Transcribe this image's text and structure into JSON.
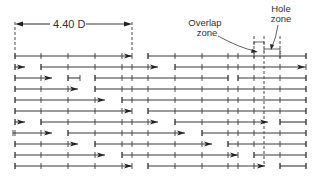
{
  "figure": {
    "dimension_label": "4.40 D",
    "overlap_label_line1": "Overlap",
    "overlap_label_line2": "zone",
    "hole_label_line1": "Hole",
    "hole_label_line2": "zone",
    "colors": {
      "ink": "#3a3a3a",
      "background": "#ffffff"
    }
  },
  "layout": {
    "row_y_start": 56,
    "row_spacing": 11,
    "tick_half_height": 3
  },
  "rows": [
    {
      "segments": [
        [
          15,
          132,
          "arrow"
        ],
        [
          148,
          306,
          "tick"
        ]
      ]
    },
    {
      "segments": [
        [
          15,
          25,
          "arrow"
        ],
        [
          41,
          158,
          "arrow"
        ],
        [
          175,
          306,
          "arrow-end"
        ]
      ]
    },
    {
      "segments": [
        [
          15,
          52,
          "arrow"
        ],
        [
          68,
          80,
          "tick"
        ],
        [
          95,
          228,
          "tick"
        ],
        [
          238,
          306,
          "tick"
        ]
      ]
    },
    {
      "segments": [
        [
          15,
          78,
          "arrow"
        ],
        [
          95,
          306,
          "tick"
        ]
      ]
    },
    {
      "segments": [
        [
          15,
          105,
          "arrow"
        ],
        [
          122,
          306,
          "tick"
        ]
      ]
    },
    {
      "segments": [
        [
          15,
          132,
          "arrow"
        ],
        [
          148,
          306,
          "tick"
        ]
      ]
    },
    {
      "segments": [
        [
          15,
          25,
          "arrow"
        ],
        [
          41,
          158,
          "arrow"
        ],
        [
          175,
          268,
          "arrow"
        ],
        [
          280,
          306,
          "tick"
        ]
      ]
    },
    {
      "segments": [
        [
          13,
          52,
          "arrow"
        ],
        [
          68,
          185,
          "arrow"
        ],
        [
          202,
          306,
          "tick"
        ]
      ]
    },
    {
      "segments": [
        [
          15,
          78,
          "arrow"
        ],
        [
          95,
          212,
          "arrow"
        ],
        [
          228,
          306,
          "tick"
        ]
      ]
    },
    {
      "segments": [
        [
          15,
          105,
          "arrow"
        ],
        [
          122,
          238,
          "arrow"
        ],
        [
          254,
          306,
          "tick"
        ]
      ]
    },
    {
      "segments": [
        [
          15,
          132,
          "arrow"
        ],
        [
          148,
          265,
          "arrow"
        ],
        [
          280,
          306,
          "tick"
        ]
      ]
    }
  ],
  "ticks_x": [
    15,
    41,
    68,
    95,
    122,
    132,
    148,
    175,
    202,
    228,
    238,
    254,
    280,
    306
  ]
}
